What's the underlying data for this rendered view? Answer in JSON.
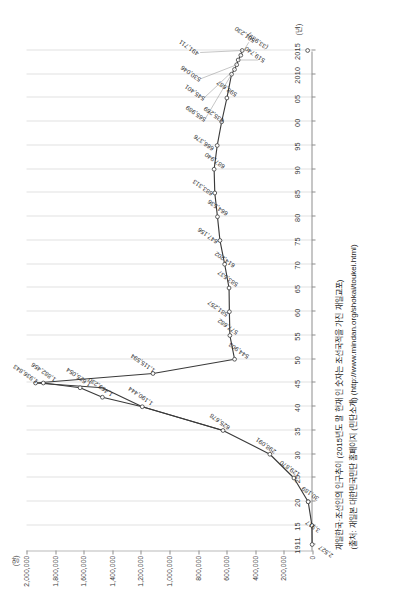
{
  "figure": {
    "y_unit": "(명)",
    "x_unit": "(년)",
    "caption_title": "재일한국·조선인의 인구추이 (2015년도 말 현재 외국인 등록 인구)",
    "caption_line1": "재일한국·조선인의 인구추이 (2015년도 말 현재 인 숫자는 조선국적을 가진 재일교포)",
    "caption_line2": "(출처: 재일본 대한민국민단 홈페이지 (민단소개) (http://www.mindan.org/shokai/toukei.html)"
  },
  "chart_data": {
    "type": "line",
    "title": "재일한국·조선인의 인구추이 (2015년도 말 현재 인 숫자는 조선국적을 가진 재일교포)",
    "xlabel": "(년)",
    "ylabel": "(명)",
    "ylim": [
      0,
      2000000
    ],
    "ytick_labels": [
      "0",
      "200,000",
      "400,000",
      "600,000",
      "800,000",
      "1,000,000",
      "1,200,000",
      "1,400,000",
      "1,600,000",
      "1,800,000",
      "2,000,000"
    ],
    "ytick_values": [
      0,
      200000,
      400000,
      600000,
      800000,
      1000000,
      1200000,
      1400000,
      1600000,
      1800000,
      2000000
    ],
    "xtick_labels": [
      "1911",
      "15",
      "20",
      "25",
      "30",
      "35",
      "40",
      "45",
      "50",
      "55",
      "60",
      "65",
      "70",
      "75",
      "80",
      "85",
      "90",
      "95",
      "00",
      "05",
      "2010",
      "2015"
    ],
    "grid": "vertical",
    "legend": "none",
    "marker": "open-circle",
    "x": [
      1911,
      1915,
      1920,
      1925,
      1930,
      1935,
      1940,
      1944,
      1945,
      1950,
      1955,
      1960,
      1965,
      1970,
      1975,
      1980,
      1985,
      1990,
      1995,
      2000,
      2005,
      2010,
      2011,
      2012,
      2013,
      2014,
      2015
    ],
    "values": [
      2527,
      3917,
      30189,
      129870,
      298091,
      625678,
      1190444,
      1469230,
      1936843,
      544903,
      577682,
      581257,
      583537,
      614202,
      647156,
      664536,
      683313,
      687940,
      666376,
      635269,
      598687,
      565989,
      545401,
      530046,
      519740,
      501230,
      491711
    ],
    "point_labels": [
      {
        "x": 1911,
        "value": 2527,
        "label": "2,527"
      },
      {
        "x": 1915,
        "value": 3917,
        "label": "3,917"
      },
      {
        "x": 1920,
        "value": 30189,
        "label": "30,189"
      },
      {
        "x": 1925,
        "value": 129870,
        "label": "129,870"
      },
      {
        "x": 1930,
        "value": 298091,
        "label": "298,091"
      },
      {
        "x": 1935,
        "value": 625678,
        "label": "625,678"
      },
      {
        "x": 1940,
        "value": 1190444,
        "label": "1,190,444"
      },
      {
        "x": 1942,
        "value": 1469230,
        "label": "1,469,230"
      },
      {
        "x": 1944,
        "value": 1625054,
        "label": "1,625,054"
      },
      {
        "x": 1945,
        "value": 1882456,
        "label": "1,882,456"
      },
      {
        "x": 1945,
        "value": 1936843,
        "label": "1,936,843"
      },
      {
        "x": 1947,
        "value": 1115594,
        "label": "1,115,594"
      },
      {
        "x": 1950,
        "value": 544903,
        "label": "544,903"
      },
      {
        "x": 1955,
        "value": 577682,
        "label": "577,682"
      },
      {
        "x": 1960,
        "value": 581257,
        "label": "581,257"
      },
      {
        "x": 1965,
        "value": 583537,
        "label": "583,537"
      },
      {
        "x": 1970,
        "value": 614202,
        "label": "614,202"
      },
      {
        "x": 1975,
        "value": 647156,
        "label": "647,156"
      },
      {
        "x": 1980,
        "value": 664536,
        "label": "664,536"
      },
      {
        "x": 1985,
        "value": 683313,
        "label": "683,313"
      },
      {
        "x": 1990,
        "value": 687940,
        "label": "687,940"
      },
      {
        "x": 1995,
        "value": 666376,
        "label": "666,376"
      },
      {
        "x": 2000,
        "value": 635269,
        "label": "635,269"
      },
      {
        "x": 2005,
        "value": 598687,
        "label": "598,687"
      },
      {
        "x": 2010,
        "value": 565989,
        "label": "565,989"
      },
      {
        "x": 2011,
        "value": 545401,
        "label": "545,401"
      },
      {
        "x": 2012,
        "value": 530046,
        "label": "530,046"
      },
      {
        "x": 2013,
        "value": 519740,
        "label": "519,740"
      },
      {
        "x": 2014,
        "value": 501230,
        "label": "501,230"
      },
      {
        "x": 2015,
        "value": 491711,
        "label": "491,711"
      },
      {
        "x": 2015,
        "value": 33939,
        "label": "(33,939)"
      }
    ]
  },
  "colors": {
    "line": "#3a3a3a",
    "grid": "#e2e2e2",
    "axis": "#8d8d8d",
    "text": "#2b2b2b"
  }
}
